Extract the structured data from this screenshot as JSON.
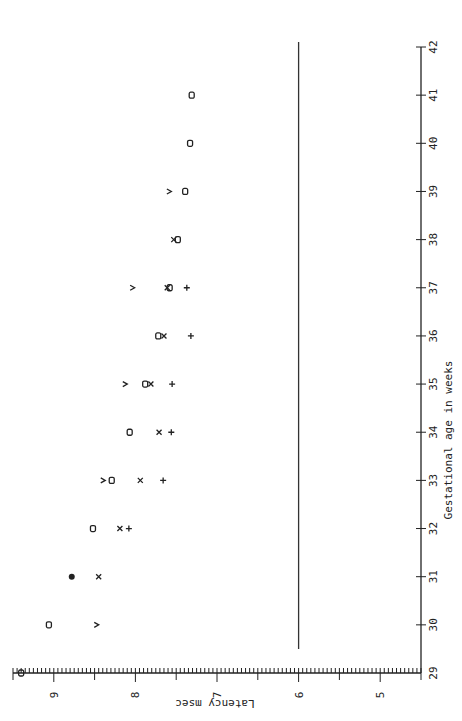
{
  "chart_data": {
    "type": "scatter",
    "orientation": "rotated-90-ccw",
    "title": "",
    "xlabel": "Gestational age in weeks",
    "ylabel": "Latency msec",
    "xlim": [
      29,
      42
    ],
    "ylim": [
      4.5,
      9.5
    ],
    "x_ticks": [
      29,
      30,
      31,
      32,
      33,
      34,
      35,
      36,
      37,
      38,
      39,
      40,
      41,
      42
    ],
    "y_ticks": [
      5,
      6,
      7,
      8,
      9
    ],
    "y_tick_labels": [
      "5",
      "6",
      "7",
      "8",
      "9"
    ],
    "x_tick_labels": [
      "29",
      "30",
      "31",
      "32",
      "33",
      "34",
      "35",
      "36",
      "37",
      "38",
      "39",
      "40",
      "41",
      "42"
    ],
    "y_minor_step": 0.05,
    "y_half_step": 0.5,
    "grid": false,
    "reference_line": {
      "y": 6.0,
      "x_range": [
        29.5,
        42
      ]
    },
    "series": [
      {
        "name": "o",
        "marker": "o",
        "points": [
          [
            29,
            9.4
          ],
          [
            30,
            9.06
          ],
          [
            32,
            8.52
          ],
          [
            33,
            8.29
          ],
          [
            34,
            8.07
          ],
          [
            35,
            7.88
          ],
          [
            36,
            7.72
          ],
          [
            37,
            7.58
          ],
          [
            38,
            7.48
          ],
          [
            39,
            7.39
          ],
          [
            40,
            7.33
          ],
          [
            41,
            7.31
          ]
        ]
      },
      {
        "name": "v",
        "marker": "v",
        "points": [
          [
            30,
            8.48
          ],
          [
            33,
            8.4
          ],
          [
            35,
            8.13
          ],
          [
            37,
            8.04
          ],
          [
            39,
            7.59
          ]
        ]
      },
      {
        "name": "x",
        "marker": "x",
        "points": [
          [
            31,
            8.45
          ],
          [
            32,
            8.19
          ],
          [
            33,
            7.94
          ],
          [
            34,
            7.71
          ],
          [
            35,
            7.81
          ],
          [
            36,
            7.65
          ],
          [
            37,
            7.61
          ],
          [
            38,
            7.53
          ]
        ]
      },
      {
        "name": "+",
        "marker": "+",
        "points": [
          [
            32,
            8.08
          ],
          [
            33,
            7.66
          ],
          [
            34,
            7.56
          ],
          [
            35,
            7.55
          ],
          [
            36,
            7.32
          ],
          [
            37,
            7.37
          ]
        ]
      },
      {
        "name": "filled",
        "marker": "•",
        "points": [
          [
            31,
            8.78
          ]
        ]
      }
    ]
  }
}
